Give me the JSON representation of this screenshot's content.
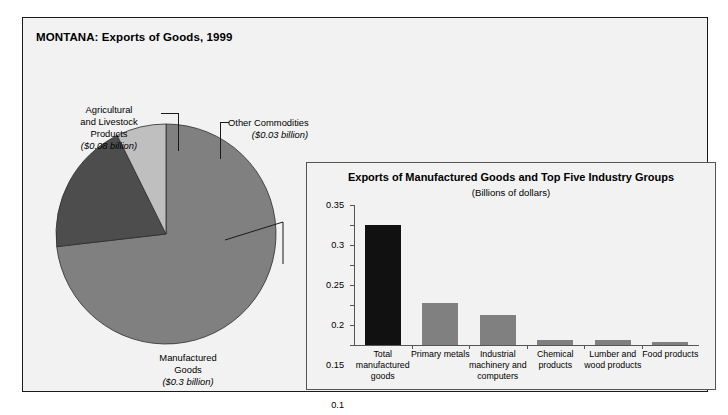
{
  "figure": {
    "title": "MONTANA: Exports of Goods, 1999"
  },
  "pie_labels": {
    "agricultural": {
      "name": "Agricultural and Livestock Products",
      "line1": "Agricultural",
      "line2": "and Livestock",
      "line3": "Products",
      "value": "($0.08 billion)"
    },
    "other": {
      "name": "Other Commodities",
      "line1": "Other Commodities",
      "value": "($0.03 billion)"
    },
    "manufactured": {
      "name": "Manufactured Goods",
      "line1": "Manufactured",
      "line2": "Goods",
      "value": "($0.3 billion)"
    }
  },
  "inset": {
    "title": "Exports of Manufactured Goods and Top Five Industry Groups",
    "subtitle": "(Billions of dollars)"
  },
  "colors": {
    "bar_total": "#111111",
    "bar_other": "#808080",
    "pie_manufactured": "#808080",
    "pie_agricultural": "#4d4d4d",
    "pie_other": "#bfbfbf",
    "background": "#f2f2f2",
    "frame": "#1a1a1a",
    "axis": "#555555"
  },
  "chart_data": [
    {
      "type": "pie",
      "title": "MONTANA: Exports of Goods, 1999",
      "unit": "Billions of dollars",
      "labels": [
        "Manufactured Goods",
        "Agricultural and Livestock Products",
        "Other Commodities"
      ],
      "values": [
        0.3,
        0.08,
        0.03
      ],
      "value_labels": [
        "($0.3 billion)",
        "($0.08 billion)",
        "($0.03 billion)"
      ],
      "colors": [
        "#808080",
        "#4d4d4d",
        "#bfbfbf"
      ],
      "legend": "none",
      "start_angle_deg": 0,
      "direction": "clockwise"
    },
    {
      "type": "bar",
      "title": "Exports of Manufactured Goods and Top Five Industry Groups",
      "subtitle": "(Billions of dollars)",
      "xlabel": "",
      "ylabel": "",
      "ylim": [
        0,
        0.35
      ],
      "yticks": [
        0,
        0.05,
        0.1,
        0.15,
        0.2,
        0.25,
        0.3,
        0.35
      ],
      "ytick_labels": [
        "0",
        "0.05",
        "0.1",
        "0.15",
        "0.2",
        "0.25",
        "0.3",
        "0.35"
      ],
      "grid": false,
      "legend": "none",
      "categories": [
        "Total manufactured goods",
        "Primary metals",
        "Industrial machinery and computers",
        "Chemical products",
        "Lumber and wood products",
        "Food products"
      ],
      "category_lines": [
        [
          "Total",
          "manufactured",
          "goods"
        ],
        [
          "Primary metals"
        ],
        [
          "Industrial",
          "machinery and",
          "computers"
        ],
        [
          "Chemical",
          "products"
        ],
        [
          "Lumber and",
          "wood products"
        ],
        [
          "Food products"
        ]
      ],
      "values": [
        0.3,
        0.105,
        0.075,
        0.013,
        0.012,
        0.007
      ],
      "bar_colors": [
        "#111111",
        "#808080",
        "#808080",
        "#808080",
        "#808080",
        "#808080"
      ]
    }
  ]
}
